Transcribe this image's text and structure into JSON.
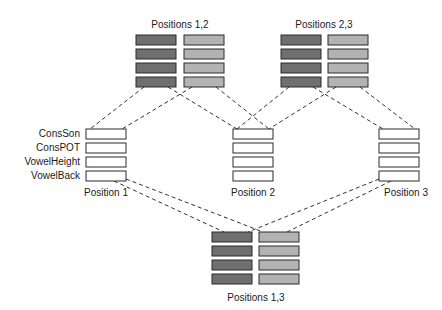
{
  "diagram": {
    "colors": {
      "dark_fill": "#6f6f6f",
      "light_fill": "#b3b3b3",
      "empty_fill": "#ffffff",
      "stroke": "#2a2a2a",
      "line": "#333333"
    },
    "feature_labels": [
      "ConsSon",
      "ConsPOT",
      "VowelHeight",
      "VowelBack"
    ],
    "positions": [
      {
        "id": "p1",
        "label": "Position 1"
      },
      {
        "id": "p2",
        "label": "Position 2"
      },
      {
        "id": "p3",
        "label": "Position 3"
      }
    ],
    "pairs": [
      {
        "id": "p12",
        "label": "Positions 1,2",
        "connects": [
          "p1",
          "p2"
        ]
      },
      {
        "id": "p23",
        "label": "Positions 2,3",
        "connects": [
          "p2",
          "p3"
        ]
      },
      {
        "id": "p13",
        "label": "Positions 1,3",
        "connects": [
          "p1",
          "p3"
        ]
      }
    ]
  }
}
